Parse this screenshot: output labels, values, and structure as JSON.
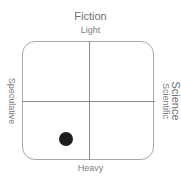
{
  "chart": {
    "title_top": "Fiction",
    "title_right": "Science",
    "axes": {
      "top": "Light",
      "bottom": "Heavy",
      "left": "Speculative",
      "right": "Scientific"
    },
    "marker": {
      "color": "#1e1e1e",
      "quadrant": "bottom-left"
    },
    "colors": {
      "border": "#a8a8a8",
      "gridline": "#8c8c8c",
      "text": "#707070"
    }
  }
}
